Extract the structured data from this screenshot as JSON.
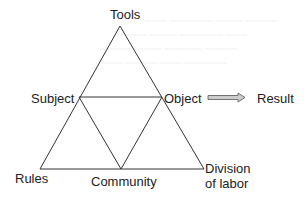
{
  "diagram": {
    "nodes": {
      "tools": "Tools",
      "subject": "Subject",
      "object": "Object",
      "result": "Result",
      "rules": "Rules",
      "community": "Community",
      "division_of_labor_line1": "Division",
      "division_of_labor_line2": "of labor"
    },
    "edges": [
      {
        "from": "Subject",
        "to": "Object"
      },
      {
        "from": "Tools",
        "to": "Rules"
      },
      {
        "from": "Tools",
        "to": "Division of labor"
      },
      {
        "from": "Rules",
        "to": "Division of labor"
      },
      {
        "from": "Subject",
        "to": "Community"
      },
      {
        "from": "Object",
        "to": "Community"
      },
      {
        "from": "Object",
        "to": "Result",
        "style": "double-arrow"
      }
    ],
    "colors": {
      "line": "#333333",
      "arrow_fill": "#cccccc",
      "text": "#222222"
    }
  }
}
